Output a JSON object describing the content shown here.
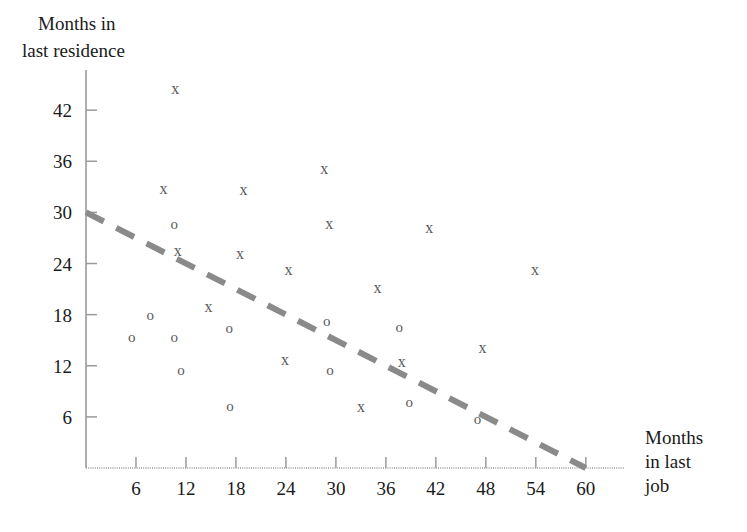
{
  "chart_data": {
    "type": "scatter",
    "title": "",
    "ylabel_lines": [
      "Months in",
      "last residence"
    ],
    "xlabel_lines": [
      "Months",
      "in last",
      "job"
    ],
    "xlabel": "Months in last job",
    "ylabel": "Months in last residence",
    "xlim": [
      0,
      63
    ],
    "ylim": [
      0,
      46
    ],
    "xticks": [
      6,
      12,
      18,
      24,
      30,
      36,
      42,
      48,
      54,
      60
    ],
    "yticks": [
      6,
      12,
      18,
      24,
      30,
      36,
      42
    ],
    "xtick_labels": [
      "6",
      "12",
      "18",
      "24",
      "30",
      "36",
      "42",
      "48",
      "54",
      "60"
    ],
    "ytick_labels": [
      "6",
      "12",
      "18",
      "24",
      "30",
      "36",
      "42"
    ],
    "grid": false,
    "legend": "none",
    "marker_color": "#5f5f5f",
    "axis_color": "#9a9a9a",
    "trendline_color": "#8a8a8a",
    "series": [
      {
        "name": "x-group",
        "marker": "x",
        "glyph": "x",
        "points": [
          {
            "x": 10.7,
            "y": 44.5
          },
          {
            "x": 9.3,
            "y": 32.8
          },
          {
            "x": 18.9,
            "y": 32.7
          },
          {
            "x": 28.6,
            "y": 35.1
          },
          {
            "x": 11.0,
            "y": 25.5
          },
          {
            "x": 18.5,
            "y": 25.2
          },
          {
            "x": 24.3,
            "y": 23.3
          },
          {
            "x": 29.2,
            "y": 28.7
          },
          {
            "x": 41.2,
            "y": 28.2
          },
          {
            "x": 53.9,
            "y": 23.3
          },
          {
            "x": 14.7,
            "y": 19.0
          },
          {
            "x": 35.0,
            "y": 21.2
          },
          {
            "x": 23.9,
            "y": 12.7
          },
          {
            "x": 37.9,
            "y": 12.5
          },
          {
            "x": 33.0,
            "y": 7.2
          },
          {
            "x": 47.6,
            "y": 14.1
          }
        ]
      },
      {
        "name": "o-group",
        "marker": "o",
        "glyph": "o",
        "points": [
          {
            "x": 5.5,
            "y": 15.4
          },
          {
            "x": 7.7,
            "y": 18.0
          },
          {
            "x": 10.6,
            "y": 15.4
          },
          {
            "x": 10.6,
            "y": 28.6
          },
          {
            "x": 11.4,
            "y": 11.5
          },
          {
            "x": 17.2,
            "y": 16.4
          },
          {
            "x": 17.3,
            "y": 7.3
          },
          {
            "x": 28.9,
            "y": 17.2
          },
          {
            "x": 29.3,
            "y": 11.5
          },
          {
            "x": 37.6,
            "y": 16.5
          },
          {
            "x": 38.8,
            "y": 7.8
          },
          {
            "x": 47.0,
            "y": 5.8
          }
        ]
      }
    ],
    "trendline": {
      "style": "dashed",
      "from": {
        "x": 0,
        "y": 30
      },
      "to": {
        "x": 60,
        "y": 0
      }
    }
  }
}
